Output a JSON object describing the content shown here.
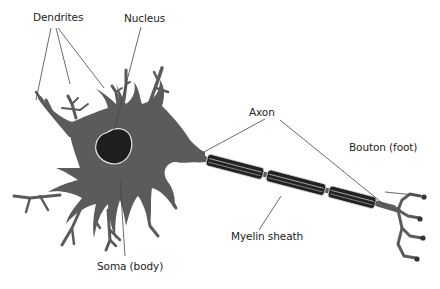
{
  "diagram": {
    "labels": {
      "dendrites": "Dendrites",
      "nucleus": "Nucleus",
      "axon": "Axon",
      "bouton": "Bouton (foot)",
      "myelin": "Myelin sheath",
      "soma": "Soma (body)"
    },
    "colors": {
      "cell_body": "#5b5b5b",
      "nucleus": "#1e1e1e",
      "myelin": "#2a2a2a",
      "leader_lines": "#444444",
      "background": "#ffffff"
    }
  }
}
